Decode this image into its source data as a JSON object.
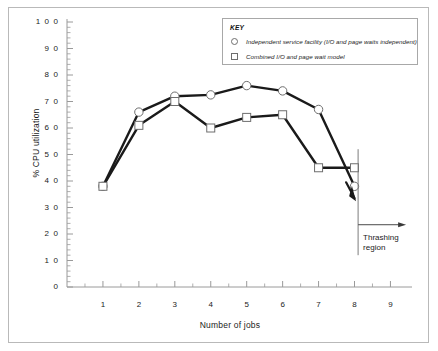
{
  "chart_data": {
    "type": "line",
    "title": "",
    "xlabel": "Number of jobs",
    "ylabel": "% CPU utilization",
    "xlim": [
      0,
      9.6
    ],
    "ylim": [
      0,
      100
    ],
    "x": [
      1,
      2,
      3,
      4,
      5,
      6,
      7,
      8
    ],
    "xticks": [
      "1",
      "2",
      "3",
      "4",
      "5",
      "6",
      "7",
      "8",
      "9"
    ],
    "xtick_values": [
      1,
      2,
      3,
      4,
      5,
      6,
      7,
      8,
      9
    ],
    "yticks": [
      "0",
      "1 0",
      "2 0",
      "3 0",
      "4 0",
      "5 0",
      "6 0",
      "7 0",
      "8 0",
      "9 0",
      "1 0 0"
    ],
    "ytick_values": [
      0,
      10,
      20,
      30,
      40,
      50,
      60,
      70,
      80,
      90,
      100
    ],
    "minor_tick_step": 2,
    "grid": false,
    "legend_position": "top-right",
    "series": [
      {
        "name": "Independent service facility (I/O and page waits independent)",
        "marker": "circle",
        "values": [
          38,
          66,
          72,
          72.5,
          76,
          74,
          67,
          38
        ]
      },
      {
        "name": "Combined I/O and page wait model",
        "marker": "square",
        "values": [
          38,
          61,
          70,
          60,
          64,
          65,
          45,
          45
        ]
      }
    ],
    "annotations": [
      {
        "name": "thrashing-region",
        "text_line_1": "Thrashing",
        "text_line_2": "region",
        "divider_x": 8.1,
        "arrow_direction": "right"
      }
    ]
  },
  "legend": {
    "title": "KEY",
    "entries": [
      {
        "marker": "circle",
        "label": "Independent service facility (I/O and page waits independent)"
      },
      {
        "marker": "square",
        "label": "Combined I/O and page wait model"
      }
    ]
  },
  "axes": {
    "x_title": "Number of jobs",
    "y_title": "% CPU utilization"
  },
  "colors": {
    "line": "#1a1a1a",
    "marker_edge": "#6e6e6e",
    "marker_fill": "#ffffff",
    "axis": "#9a9a9a",
    "frame": "#b9b9b9",
    "text": "#1b1b1b",
    "background": "#ffffff"
  }
}
